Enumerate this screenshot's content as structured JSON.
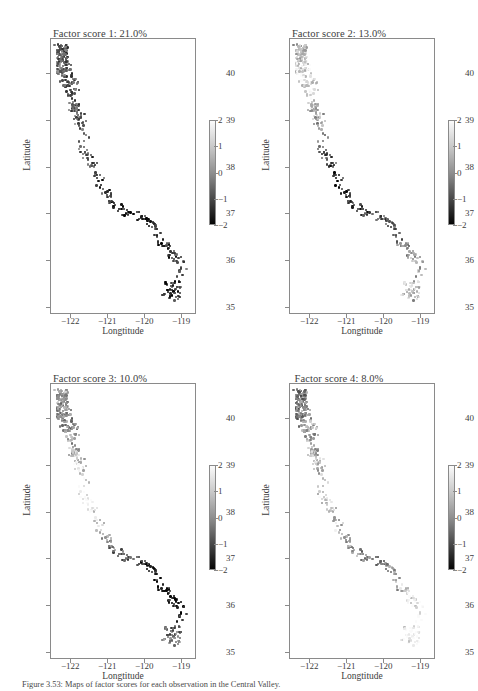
{
  "figure": {
    "caption": "Figure 3.53: Maps of factor scores for each observation in the Central Valley."
  },
  "axes": {
    "xlabel": "Longtitude",
    "ylabel": "Latitude",
    "xticks": [
      "−122",
      "−121",
      "−120",
      "−119"
    ],
    "xtick_values": [
      -122,
      -121,
      -120,
      -119
    ],
    "yticks": [
      "35",
      "36",
      "37",
      "38",
      "39",
      "40"
    ],
    "ytick_values": [
      35,
      36,
      37,
      38,
      39,
      40
    ],
    "xlim": [
      -122.55,
      -118.6
    ],
    "ylim": [
      34.85,
      40.75
    ]
  },
  "colorbar": {
    "ticks": [
      "2",
      "1",
      "0",
      "−1",
      "−2"
    ],
    "tick_values": [
      2,
      1,
      0,
      -1,
      -2
    ],
    "vmin": -2,
    "vmax": 2,
    "cmap": "gray",
    "low_color": "#050505",
    "high_color": "#fbfbfb"
  },
  "panels": [
    {
      "title": "Factor score 1: 21.0%",
      "factor": 1,
      "variance_pct": 21.0
    },
    {
      "title": "Factor score 2: 13.0%",
      "factor": 2,
      "variance_pct": 13.0
    },
    {
      "title": "Factor score 3: 10.0%",
      "factor": 3,
      "variance_pct": 10.0
    },
    {
      "title": "Factor score 4: 8.0%",
      "factor": 4,
      "variance_pct": 8.0
    }
  ],
  "chart_data": {
    "type": "scatter",
    "title": "Maps of factor scores",
    "xlabel": "Longtitude",
    "ylabel": "Latitude",
    "xlim": [
      -122.55,
      -118.6
    ],
    "ylim": [
      34.85,
      40.75
    ],
    "grid": false,
    "legend": "colorbar-right",
    "colorbar": {
      "vmin": -2,
      "vmax": 2,
      "label": "",
      "cmap": "gray"
    },
    "subplots": [
      {
        "name": "Factor score 1: 21.0%",
        "n_points": 420
      },
      {
        "name": "Factor score 2: 13.0%",
        "n_points": 420
      },
      {
        "name": "Factor score 3: 10.0%",
        "n_points": 420
      },
      {
        "name": "Factor score 4: 8.0%",
        "n_points": 420
      }
    ],
    "note": "Four maps of California Central Valley observations; marker shade encodes factor score from -2 (black) to +2 (white)."
  }
}
